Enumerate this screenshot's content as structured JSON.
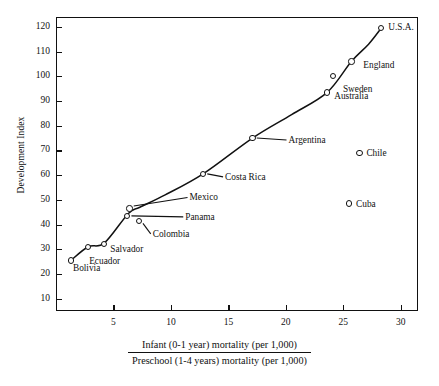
{
  "chart_data": {
    "type": "scatter",
    "title": "",
    "xlabel_numerator": "Infant (0-1 year) mortality (per 1,000)",
    "xlabel_denominator": "Preschool (1-4 years) mortality (per 1,000)",
    "ylabel": "Development Index",
    "xlim": [
      0,
      31.5
    ],
    "ylim": [
      5,
      124
    ],
    "xticks": [
      5,
      10,
      15,
      20,
      25,
      30
    ],
    "yticks": [
      10,
      20,
      30,
      40,
      50,
      60,
      70,
      80,
      90,
      100,
      110,
      120
    ],
    "grid": false,
    "legend": "none",
    "has_fitted_curve": true,
    "fitted_curve_note": "Smooth increasing curve through the on-trend countries",
    "points": [
      {
        "label": "Bolivia",
        "x": 1.3,
        "y": 25.5,
        "label_dx": 2,
        "label_dy": 8,
        "leader": false
      },
      {
        "label": "Ecuador",
        "x": 2.8,
        "y": 31.0,
        "label_dx": 1,
        "label_dy": 14,
        "leader": false
      },
      {
        "label": "Salvador",
        "x": 4.2,
        "y": 32.0,
        "label_dx": 6,
        "label_dy": 5,
        "leader": false
      },
      {
        "label": "Colombia",
        "x": 7.2,
        "y": 41.5,
        "label_dx": 14,
        "label_dy": 13,
        "leader": true
      },
      {
        "label": "Panama",
        "x": 6.2,
        "y": 43.5,
        "label_dx": 58,
        "label_dy": 1,
        "leader": true
      },
      {
        "label": "Mexico",
        "x": 6.4,
        "y": 46.5,
        "label_dx": 60,
        "label_dy": -11,
        "leader": true
      },
      {
        "label": "Costa Rica",
        "x": 12.8,
        "y": 60.5,
        "label_dx": 22,
        "label_dy": 3,
        "leader": true
      },
      {
        "label": "Argentina",
        "x": 17.1,
        "y": 75.0,
        "label_dx": 36,
        "label_dy": 2,
        "leader": true
      },
      {
        "label": "Australia",
        "x": 23.6,
        "y": 93.5,
        "label_dx": 7,
        "label_dy": 4,
        "leader": false
      },
      {
        "label": "Sweden",
        "x": 24.1,
        "y": 100.0,
        "label_dx": 10,
        "label_dy": 13,
        "leader": false
      },
      {
        "label": "England",
        "x": 25.7,
        "y": 106.0,
        "label_dx": 12,
        "label_dy": 4,
        "leader": false
      },
      {
        "label": "U.S.A.",
        "x": 28.3,
        "y": 119.5,
        "label_dx": 7,
        "label_dy": -1,
        "leader": false
      },
      {
        "label": "Chile",
        "x": 26.4,
        "y": 69.0,
        "label_dx": 7,
        "label_dy": 0,
        "leader": false
      },
      {
        "label": "Cuba",
        "x": 25.5,
        "y": 48.5,
        "label_dx": 7,
        "label_dy": 0,
        "leader": false
      }
    ],
    "colors": {
      "axis": "#111111",
      "marker_edge": "#111111",
      "marker_fill": "#ffffff",
      "curve": "#111111",
      "text": "#111111",
      "background": "#ffffff"
    }
  }
}
